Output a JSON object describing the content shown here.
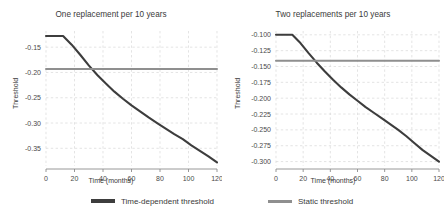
{
  "figure": {
    "width": 444,
    "height": 216,
    "background": "#ffffff",
    "grid_color": "#d9d9d9",
    "axis_color": "#8c8c8c"
  },
  "legend": {
    "position": "bottom-center",
    "entries": [
      {
        "label": "Time-dependent threshold",
        "color": "#3d3d3d",
        "style": "thick"
      },
      {
        "label": "Static threshold",
        "color": "#8f8f8f",
        "style": "thin"
      }
    ]
  },
  "chart_data": [
    {
      "type": "line",
      "title": "One replacement per 10 years",
      "xlabel": "Time (months)",
      "ylabel": "Threshold",
      "grid": true,
      "xlim": [
        0,
        120
      ],
      "ylim": [
        -0.385,
        -0.118
      ],
      "xticks": [
        0,
        20,
        40,
        60,
        80,
        100,
        120
      ],
      "xticklabels": [
        "0",
        "20",
        "40",
        "60",
        "80",
        "100",
        "120"
      ],
      "yticks": [
        -0.15,
        -0.2,
        -0.25,
        -0.3,
        -0.35
      ],
      "yticklabels": [
        "-0.15",
        "-0.20",
        "-0.25",
        "-0.30",
        "-0.35"
      ],
      "series": [
        {
          "name": "Time-dependent threshold",
          "color": "#3d3d3d",
          "x": [
            0,
            6,
            12,
            18,
            24,
            30,
            36,
            42,
            48,
            54,
            60,
            66,
            72,
            78,
            84,
            90,
            96,
            102,
            108,
            114,
            120
          ],
          "values": [
            -0.128,
            -0.128,
            -0.128,
            -0.145,
            -0.165,
            -0.186,
            -0.205,
            -0.222,
            -0.238,
            -0.252,
            -0.265,
            -0.277,
            -0.289,
            -0.3,
            -0.311,
            -0.322,
            -0.332,
            -0.344,
            -0.355,
            -0.366,
            -0.378
          ]
        },
        {
          "name": "Static threshold",
          "color": "#8f8f8f",
          "x": [
            0,
            120
          ],
          "values": [
            -0.193,
            -0.193
          ]
        }
      ]
    },
    {
      "type": "line",
      "title": "Two replacements per 10 years",
      "xlabel": "Time (months)",
      "ylabel": "Threshold",
      "grid": true,
      "xlim": [
        0,
        120
      ],
      "ylim": [
        -0.307,
        -0.094
      ],
      "xticks": [
        0,
        20,
        40,
        60,
        80,
        100,
        120
      ],
      "xticklabels": [
        "0",
        "20",
        "40",
        "60",
        "80",
        "100",
        "120"
      ],
      "yticks": [
        -0.1,
        -0.125,
        -0.15,
        -0.175,
        -0.2,
        -0.225,
        -0.25,
        -0.275,
        -0.3
      ],
      "yticklabels": [
        "-0.100",
        "-0.125",
        "-0.150",
        "-0.175",
        "-0.200",
        "-0.225",
        "-0.250",
        "-0.275",
        "-0.300"
      ],
      "series": [
        {
          "name": "Time-dependent threshold",
          "color": "#3d3d3d",
          "x": [
            0,
            6,
            12,
            18,
            24,
            30,
            36,
            42,
            48,
            54,
            60,
            66,
            72,
            78,
            84,
            90,
            96,
            102,
            108,
            114,
            120
          ],
          "values": [
            -0.1,
            -0.1,
            -0.1,
            -0.113,
            -0.129,
            -0.144,
            -0.158,
            -0.171,
            -0.183,
            -0.194,
            -0.204,
            -0.214,
            -0.223,
            -0.232,
            -0.241,
            -0.25,
            -0.26,
            -0.271,
            -0.282,
            -0.291,
            -0.3
          ]
        },
        {
          "name": "Static threshold",
          "color": "#8f8f8f",
          "x": [
            0,
            120
          ],
          "values": [
            -0.141,
            -0.141
          ]
        }
      ]
    }
  ]
}
